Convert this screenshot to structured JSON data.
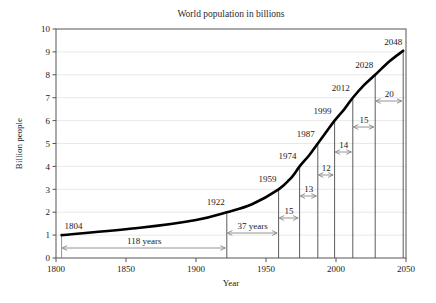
{
  "chart_data": {
    "type": "line",
    "title": "World population in billions",
    "xlabel": "Year",
    "ylabel": "Billion people",
    "xlim": [
      1800,
      2050
    ],
    "ylim": [
      0,
      10
    ],
    "xticks": [
      1800,
      1850,
      1900,
      1950,
      2000,
      2050
    ],
    "xtick_labels": [
      "1800",
      "1850",
      "1900",
      "1950",
      "2000",
      "2050"
    ],
    "yticks": [
      0,
      1,
      2,
      3,
      4,
      5,
      6,
      7,
      8,
      9,
      10
    ],
    "ytick_labels": [
      "0",
      "1",
      "2",
      "3",
      "4",
      "5",
      "6",
      "7",
      "8",
      "9",
      "10"
    ],
    "grid": "horizontal",
    "legend": "none",
    "series": [
      {
        "name": "World population",
        "x": [
          1804,
          1860,
          1900,
          1922,
          1940,
          1959,
          1968,
          1974,
          1981,
          1987,
          1993,
          1999,
          2006,
          2012,
          2020,
          2028,
          2038,
          2048
        ],
        "y": [
          1.0,
          1.32,
          1.66,
          2.0,
          2.35,
          3.0,
          3.5,
          4.0,
          4.5,
          5.0,
          5.5,
          6.0,
          6.5,
          7.0,
          7.55,
          8.0,
          8.58,
          9.05
        ]
      }
    ],
    "milestones": [
      {
        "year": 1804,
        "population": 1,
        "label": "1804"
      },
      {
        "year": 1922,
        "population": 2,
        "label": "1922"
      },
      {
        "year": 1959,
        "population": 3,
        "label": "1959"
      },
      {
        "year": 1974,
        "population": 4,
        "label": "1974"
      },
      {
        "year": 1987,
        "population": 5,
        "label": "1987"
      },
      {
        "year": 1999,
        "population": 6,
        "label": "1999"
      },
      {
        "year": 2012,
        "population": 7,
        "label": "2012"
      },
      {
        "year": 2028,
        "population": 8,
        "label": "2028"
      },
      {
        "year": 2048,
        "population": 9,
        "label": "2048"
      }
    ],
    "intervals": [
      {
        "from": 1804,
        "to": 1922,
        "years": 118,
        "label": "118 years"
      },
      {
        "from": 1922,
        "to": 1959,
        "years": 37,
        "label": "37 years"
      },
      {
        "from": 1959,
        "to": 1974,
        "years": 15,
        "label": "15"
      },
      {
        "from": 1974,
        "to": 1987,
        "years": 13,
        "label": "13"
      },
      {
        "from": 1987,
        "to": 1999,
        "years": 12,
        "label": "12"
      },
      {
        "from": 1999,
        "to": 2012,
        "years": 14,
        "label": "14"
      },
      {
        "from": 2012,
        "to": 2028,
        "years": 15,
        "label": "15"
      },
      {
        "from": 2028,
        "to": 2048,
        "years": 20,
        "label": "20"
      }
    ],
    "colors": {
      "curve": "#000000",
      "axis": "#555555",
      "grid": "#e8e8e8",
      "annotation": "#7a7a7a",
      "background": "#ffffff"
    }
  }
}
